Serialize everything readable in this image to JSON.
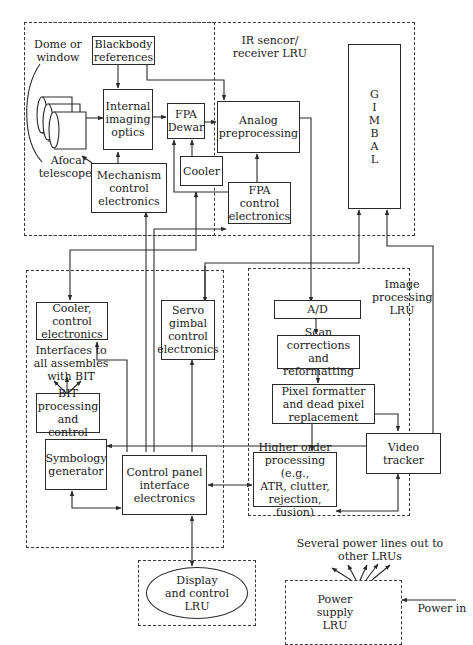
{
  "diagram": {
    "groups": {
      "ir_sensor": "IR sencor/\nreceiver LRU",
      "image_processing": "Image\nprocessing\nLRU",
      "display_control": "Display\nand control\nLRU",
      "power_supply": "Power\nsupply\nLRU"
    },
    "labels": {
      "dome": "Dome or\nwindow",
      "afocal": "Afocal\ntelescopes",
      "interfaces": "Interfaces to\nall assembles\nwith BIT",
      "power_lines": "Several power lines out to\nother LRUs",
      "power_in": "Power in"
    },
    "blocks": {
      "blackbody": "Blackbody\nreferences",
      "internal_optics": "Internal\nimaging\noptics",
      "fpa_dewar": "FPA\nDewar",
      "analog": "Analog\npreprocessing",
      "cooler": "Cooler",
      "mechanism": "Mechanism\ncontrol\nelectronics",
      "fpa_control": "FPA\ncontrol\nelectronics",
      "gimbal": "G\nI\nM\nB\nA\nL",
      "cooler_control": "Cooler, control\nelectronics",
      "servo": "Servo\ngimbal\ncontrol\nelectronics",
      "bit": "BIT\nprocessing\nand control",
      "symbology": "Symbology\ngenerator",
      "control_panel": "Control panel\ninterface\nelectronics",
      "ad": "A/D",
      "scan": "Scan corrections\nand reformatting",
      "pixel": "Pixel formatter\nand dead pixel\nreplacement",
      "video_tracker": "Video tracker",
      "higher_order": "Higher order\nprocessing (e.g.,\nATR, clutter,\nrejection, fusion)"
    },
    "colors": {
      "line": "#2a2a2a",
      "background": "#ffffff"
    }
  }
}
